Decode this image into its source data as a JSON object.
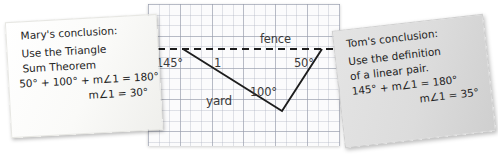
{
  "scene": {
    "width": 498,
    "height": 157,
    "background": "#ffffff"
  },
  "diagram": {
    "name": "fence-and-yard-angle-diagram",
    "paper": "graph-grid",
    "grid_color": "#969baa",
    "line_color": "#1d1d1d",
    "labels": {
      "fence": "fence",
      "yard": "yard",
      "angle_left": "145°",
      "angle_one": "1",
      "angle_right": "50°",
      "angle_vertex": "100°"
    },
    "geometry": {
      "fence_line": {
        "style": "dashed",
        "x1": 0,
        "y1": 45,
        "x2": 192,
        "y2": 45
      },
      "yard_path": [
        [
          35,
          45
        ],
        [
          134,
          106
        ],
        [
          174,
          45
        ]
      ]
    }
  },
  "notes": [
    {
      "id": "mary",
      "name": "mary-conclusion-note",
      "color": "#fafaf8",
      "title": "Mary's conclusion:",
      "lines": [
        "Use the Triangle",
        "Sum Theorem"
      ],
      "equations": [
        "50° + 100° + m∠1 = 180°",
        "m∠1 = 30°"
      ]
    },
    {
      "id": "tom",
      "name": "tom-conclusion-note",
      "color": "#dcdcdc",
      "title": "Tom's conclusion:",
      "lines": [
        "Use the definition",
        "of a linear pair."
      ],
      "equations": [
        "145° + m∠1 = 180°",
        "m∠1 = 35°"
      ]
    }
  ]
}
